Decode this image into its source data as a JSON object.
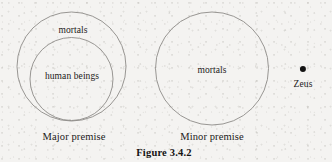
{
  "figure": {
    "caption": "Figure 3.4.2",
    "caption_x": 164,
    "caption_y": 152,
    "background_color": "#f4f3f1",
    "stroke_color": "#8d8b88",
    "text_color": "#222020"
  },
  "diagrams": [
    {
      "name": "major-premise",
      "premise_label": "Major premise",
      "premise_label_x": 74,
      "premise_label_y": 136,
      "circles": [
        {
          "name": "mortals-circle",
          "label": "mortals",
          "cx": 71.5,
          "cy": 66.5,
          "r": 54.5,
          "label_x": 73,
          "label_y": 30
        },
        {
          "name": "human-beings-circle",
          "label": "human beings",
          "cx": 71.5,
          "cy": 79,
          "r": 41.5,
          "label_x": 72,
          "label_y": 76
        }
      ]
    },
    {
      "name": "minor-premise",
      "premise_label": "Minor premise",
      "premise_label_x": 212,
      "premise_label_y": 136,
      "circles": [
        {
          "name": "mortals-circle",
          "label": "mortals",
          "cx": 212,
          "cy": 68.5,
          "r": 56.5,
          "label_x": 212,
          "label_y": 70
        }
      ],
      "points": [
        {
          "name": "zeus-point",
          "label": "Zeus",
          "cx": 303,
          "cy": 69,
          "r": 3.1,
          "label_x": 303,
          "label_y": 84
        }
      ]
    }
  ]
}
